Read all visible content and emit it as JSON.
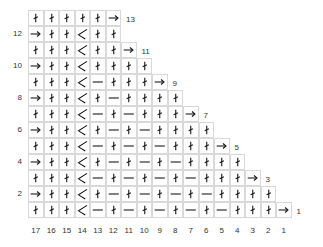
{
  "chart_data": {
    "type": "table",
    "title": "",
    "column_labels": [
      "17",
      "16",
      "15",
      "14",
      "13",
      "12",
      "11",
      "10",
      "9",
      "8",
      "7",
      "6",
      "5",
      "4",
      "3",
      "2",
      "1"
    ],
    "left_row_labels": {
      "12": "12",
      "10": "10",
      "8": "8",
      "6": "6",
      "4": "4",
      "2": "2"
    },
    "right_row_labels": {
      "13": "13",
      "11": "11",
      "9": "9",
      "7": "7",
      "5": "5",
      "3": "3",
      "1": "1"
    },
    "legend": {
      "K": "knit-stitch (vertical stroke with slash)",
      "P": "purl-dash (horizontal bar)",
      "D": "decrease (diagonal)",
      "A": "row-direction arrow (→)"
    },
    "rows": [
      {
        "row": 13,
        "cells": [
          "K",
          "K",
          "K",
          "K",
          "K",
          "A"
        ]
      },
      {
        "row": 12,
        "cells": [
          "A",
          "K",
          "K",
          "D",
          "K",
          "K"
        ]
      },
      {
        "row": 11,
        "cells": [
          "K",
          "K",
          "K",
          "D",
          "K",
          "K",
          "A"
        ]
      },
      {
        "row": 10,
        "cells": [
          "A",
          "K",
          "K",
          "D",
          "K",
          "K",
          "K",
          "K"
        ]
      },
      {
        "row": 9,
        "cells": [
          "K",
          "K",
          "K",
          "D",
          "P",
          "K",
          "K",
          "K",
          "A"
        ]
      },
      {
        "row": 8,
        "cells": [
          "A",
          "K",
          "K",
          "D",
          "K",
          "P",
          "K",
          "K",
          "K",
          "K"
        ]
      },
      {
        "row": 7,
        "cells": [
          "K",
          "K",
          "K",
          "D",
          "P",
          "K",
          "P",
          "K",
          "K",
          "K",
          "A"
        ]
      },
      {
        "row": 6,
        "cells": [
          "A",
          "K",
          "K",
          "D",
          "K",
          "P",
          "K",
          "P",
          "K",
          "K",
          "K",
          "K"
        ]
      },
      {
        "row": 5,
        "cells": [
          "K",
          "K",
          "K",
          "D",
          "P",
          "K",
          "P",
          "K",
          "P",
          "K",
          "K",
          "K",
          "A"
        ]
      },
      {
        "row": 4,
        "cells": [
          "A",
          "K",
          "K",
          "D",
          "K",
          "P",
          "K",
          "P",
          "K",
          "P",
          "K",
          "K",
          "K",
          "K"
        ]
      },
      {
        "row": 3,
        "cells": [
          "K",
          "K",
          "K",
          "D",
          "P",
          "K",
          "P",
          "K",
          "P",
          "K",
          "P",
          "K",
          "K",
          "K",
          "A"
        ]
      },
      {
        "row": 2,
        "cells": [
          "A",
          "K",
          "K",
          "D",
          "K",
          "P",
          "K",
          "P",
          "K",
          "P",
          "K",
          "P",
          "K",
          "K",
          "K",
          "K"
        ]
      },
      {
        "row": 1,
        "cells": [
          "K",
          "K",
          "K",
          "D",
          "P",
          "K",
          "P",
          "K",
          "P",
          "K",
          "P",
          "K",
          "P",
          "K",
          "K",
          "K",
          "A"
        ]
      }
    ]
  },
  "colors": {
    "grid_line": "#d9d9d9",
    "symbol": "#1a1a1a",
    "label": "#333333"
  }
}
